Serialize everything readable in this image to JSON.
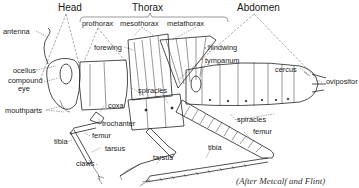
{
  "figure": {
    "regions": {
      "head": "Head",
      "thorax": "Thorax",
      "abdomen": "Abdomen"
    },
    "thorax_segments": {
      "prothorax": "prothorax",
      "mesothorax": "mesothorax",
      "metathorax": "metathorax"
    },
    "labels": {
      "antenna": "antenna",
      "ocellus": "ocellus",
      "compound_eye_line1": "compound",
      "compound_eye_line2": "eye",
      "mouthparts": "mouthparts",
      "forewing": "forewing",
      "hindwing": "hindwing",
      "tympanum": "tympanum",
      "cercus": "cercus",
      "ovipositor": "ovipositor",
      "spiracles_thorax": "spiracles",
      "spiracles_abdomen": "spiracles",
      "coxa": "coxa",
      "trochanter": "trochanter",
      "femur_foreleg": "femur",
      "tibia_foreleg": "tibia",
      "tarsus_foreleg": "tarsus",
      "claws": "claws",
      "tarsus_midleg": "tarsus",
      "femur_hindleg": "femur",
      "tibia_hindleg": "tibia"
    },
    "credit": "(After Metcalf and Flint)"
  }
}
